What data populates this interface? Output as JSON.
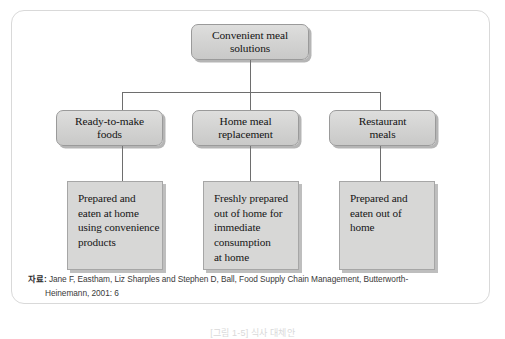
{
  "figure": {
    "root": {
      "label": "Convenient meal\nsolutions"
    },
    "branches": [
      {
        "id": "ready-to-make-foods",
        "label": "Ready-to-make\nfoods",
        "description": "Prepared  and\neaten at home\nusing convenience\nproducts"
      },
      {
        "id": "home-meal-replacement",
        "label": "Home meal\nreplacement",
        "description": "Freshly prepared\nout of home for\nimmediate\nconsumption\nat home"
      },
      {
        "id": "restaurant-meals",
        "label": "Restaurant\nmeals",
        "description": "Prepared and\neaten out of\nhome"
      }
    ],
    "source": {
      "label": "자료:",
      "line1": "Jane F, Eastham, Liz Sharples and Stephen D, Ball, Food Supply Chain Management, Butterworth-",
      "line2": "Heinemann, 2001: 6"
    },
    "caption": "[그림 1-5] 식사 대체안"
  },
  "colors": {
    "node_fill": "#d5d5d4",
    "node_border": "#9a9a9a",
    "desc_fill": "#d7d7d6",
    "desc_border": "#a6a6a6",
    "connector": "#6e6e6e",
    "frame_border": "#d9d9d9",
    "page_background": "#ffffff",
    "text": "#141414"
  }
}
